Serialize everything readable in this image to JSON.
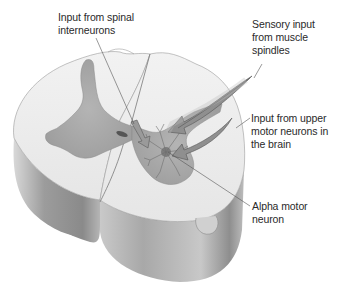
{
  "figure": {
    "colors": {
      "white_matter": "#ececec",
      "gray_matter": "#a9a9a9",
      "arrow_fill": "#8c8c8c",
      "side_shading": "#9a9a9a",
      "label_text": "#2a2a2a",
      "leader_line": "#555555"
    }
  },
  "labels": {
    "interneurons": "Input from spinal\ninterneurons",
    "sensory": "Sensory input\nfrom muscle\nspindles",
    "upper_motor": "Input from upper\nmotor neurons in\nthe brain",
    "alpha_motor": "Alpha motor\nneuron"
  }
}
